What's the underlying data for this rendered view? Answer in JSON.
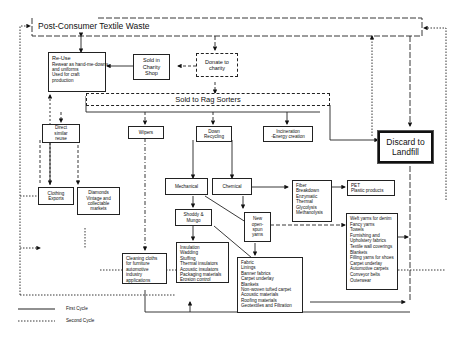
{
  "title": "Post-Consumer Textile Waste",
  "nodes": {
    "reuse": {
      "title": "Re-Use",
      "lines": [
        "Rewear as hand-me-downs",
        "and uniforms",
        "Used for craft",
        "production"
      ]
    },
    "sold_charity": {
      "lines": [
        "Sold in",
        "Charity",
        "Shop"
      ]
    },
    "donate": {
      "lines": [
        "Donate to",
        "charity"
      ]
    },
    "rag_sorters": {
      "label": "Sold to Rag Sorters"
    },
    "direct_reuse": {
      "lines": [
        "Direct",
        "similar",
        "reuse"
      ]
    },
    "wipers": {
      "label": "Wipers"
    },
    "down_recycling": {
      "lines": [
        "Down",
        "Recycling"
      ]
    },
    "incineration": {
      "lines": [
        "Incineration",
        "-Energy creation"
      ]
    },
    "discard": {
      "lines": [
        "Discard to",
        "Landfill"
      ]
    },
    "clothing_exports": {
      "lines": [
        "Clothing",
        "Exports"
      ]
    },
    "diamonds": {
      "lines": [
        "Diamonds",
        "Vintage and",
        "collectable",
        "markets"
      ]
    },
    "mechanical": {
      "label": "Mechanical"
    },
    "chemical": {
      "label": "Chemical"
    },
    "fibre_breakdown": {
      "lines": [
        "Fiber",
        "Breakdown",
        "Enzymatic",
        "Thermal",
        "Glycolysis",
        "Methanolysis"
      ]
    },
    "pet": {
      "lines": [
        "PET",
        "Plastic products"
      ]
    },
    "shoddy": {
      "lines": [
        "Shoddy &",
        "Mungo"
      ]
    },
    "new_yarns": {
      "lines": [
        "New",
        "open-",
        "spun",
        "yarns"
      ]
    },
    "cleaning_cloths": {
      "lines": [
        "Cleaning cloths",
        "for furniture",
        "automotive",
        "industry",
        "applications"
      ]
    },
    "insulation": {
      "lines": [
        "Insulation",
        "Wadding",
        "Stuffing",
        "Thermal insulators",
        "Acoustic insulators",
        "Packaging materials",
        "Erosion control"
      ]
    },
    "fabric": {
      "lines": [
        "Fabric",
        "Linings",
        "Banner fabrics",
        "Carpet underlay",
        "Blankets",
        "Non-woven tufted carpet",
        "Acoustic materials",
        "Roofing materials",
        "Geotextiles and Filtration"
      ]
    },
    "yarn_products": {
      "lines": [
        "Weft yarns for denim",
        "Fancy yarns",
        "Towels",
        "Furnishing and",
        "Upholstery fabrics",
        "Textile wall coverings",
        "Blankets",
        "Filling yarns for shoes",
        "Carpet underlay",
        "Automotive carpets",
        "Conveyor belts",
        "Outerwear"
      ]
    }
  },
  "legend": {
    "first_cycle": "First Cycle",
    "second_cycle": "Second Cycle"
  }
}
